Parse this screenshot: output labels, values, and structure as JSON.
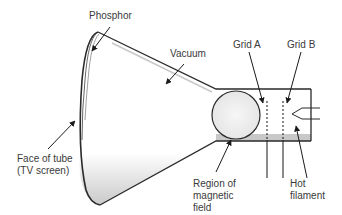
{
  "diagram": {
    "labels": {
      "phosphor": "Phosphor",
      "vacuum": "Vacuum",
      "grid_a": "Grid A",
      "grid_b": "Grid B",
      "face_line1": "Face of tube",
      "face_line2": "(TV screen)",
      "region_line1": "Region of",
      "region_line2": "magnetic",
      "region_line3": "field",
      "hot_line1": "Hot",
      "hot_line2": "filament"
    },
    "colors": {
      "outline": "#2a2a2a",
      "shading": "#c8c8c8",
      "text": "#3a3a3a"
    }
  }
}
